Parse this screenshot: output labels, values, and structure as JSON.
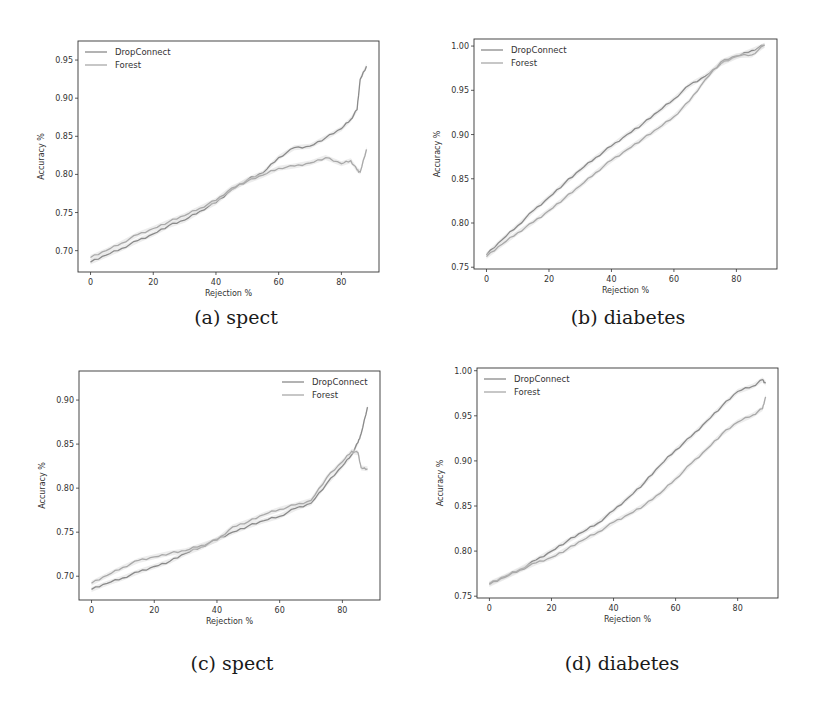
{
  "figure": {
    "captions": [
      "(a) spect",
      "(b) diabetes",
      "(c) spect",
      "(d) diabetes"
    ]
  },
  "colors": {
    "dropconnect": "#8a8a8a",
    "forest": "#a9a9a9",
    "band": "#dcdcdc",
    "frame": "#333333"
  },
  "chart_data": [
    {
      "id": "a",
      "type": "line",
      "title": "",
      "caption": "(a) spect",
      "xlabel": "Rejection %",
      "ylabel": "Accuracy %",
      "xlim": [
        -4,
        92
      ],
      "ylim": [
        0.672,
        0.975
      ],
      "xticks": [
        0,
        20,
        40,
        60,
        80
      ],
      "yticks": [
        0.7,
        0.75,
        0.8,
        0.85,
        0.9,
        0.95
      ],
      "ytick_labels": [
        "0.70",
        "0.75",
        "0.80",
        "0.85",
        "0.90",
        "0.95"
      ],
      "grid": false,
      "legend": {
        "position": "upper left",
        "entries": [
          "DropConnect",
          "Forest"
        ]
      },
      "x": [
        0,
        5,
        10,
        15,
        20,
        25,
        30,
        35,
        40,
        45,
        50,
        55,
        60,
        65,
        70,
        75,
        80,
        83,
        85,
        86,
        88
      ],
      "series": [
        {
          "name": "DropConnect",
          "values": [
            0.685,
            0.694,
            0.703,
            0.713,
            0.722,
            0.733,
            0.74,
            0.752,
            0.763,
            0.78,
            0.793,
            0.802,
            0.822,
            0.835,
            0.837,
            0.848,
            0.86,
            0.872,
            0.885,
            0.925,
            0.942
          ]
        },
        {
          "name": "Forest",
          "values": [
            0.691,
            0.7,
            0.71,
            0.721,
            0.729,
            0.738,
            0.746,
            0.756,
            0.766,
            0.782,
            0.791,
            0.799,
            0.808,
            0.811,
            0.815,
            0.822,
            0.814,
            0.818,
            0.806,
            0.803,
            0.833
          ]
        }
      ]
    },
    {
      "id": "b",
      "type": "line",
      "title": "",
      "caption": "(b) diabetes",
      "xlabel": "Rejection %",
      "ylabel": "Accuracy %",
      "xlim": [
        -4,
        93
      ],
      "ylim": [
        0.748,
        1.008
      ],
      "xticks": [
        0,
        20,
        40,
        60,
        80
      ],
      "yticks": [
        0.75,
        0.8,
        0.85,
        0.9,
        0.95,
        1.0
      ],
      "ytick_labels": [
        "0.75",
        "0.80",
        "0.85",
        "0.90",
        "0.95",
        "1.00"
      ],
      "grid": false,
      "legend": {
        "position": "upper left",
        "entries": [
          "DropConnect",
          "Forest"
        ]
      },
      "x": [
        0,
        5,
        10,
        15,
        20,
        25,
        30,
        35,
        40,
        45,
        50,
        55,
        60,
        65,
        70,
        75,
        80,
        85,
        89
      ],
      "series": [
        {
          "name": "DropConnect",
          "values": [
            0.764,
            0.781,
            0.797,
            0.814,
            0.829,
            0.845,
            0.86,
            0.874,
            0.887,
            0.9,
            0.912,
            0.926,
            0.94,
            0.956,
            0.966,
            0.98,
            0.988,
            0.995,
            1.001
          ]
        },
        {
          "name": "Forest",
          "values": [
            0.762,
            0.776,
            0.789,
            0.801,
            0.814,
            0.828,
            0.842,
            0.857,
            0.871,
            0.883,
            0.895,
            0.907,
            0.92,
            0.938,
            0.962,
            0.982,
            0.989,
            0.99,
            1.001
          ]
        }
      ]
    },
    {
      "id": "c",
      "type": "line",
      "title": "",
      "caption": "(c) spect",
      "xlabel": "Rejection %",
      "ylabel": "Accuracy %",
      "xlim": [
        -4,
        92
      ],
      "ylim": [
        0.673,
        0.933
      ],
      "xticks": [
        0,
        20,
        40,
        60,
        80
      ],
      "yticks": [
        0.7,
        0.75,
        0.8,
        0.85,
        0.9
      ],
      "ytick_labels": [
        "0.70",
        "0.75",
        "0.80",
        "0.85",
        "0.90"
      ],
      "grid": false,
      "legend": {
        "position": "upper right",
        "entries": [
          "DropConnect",
          "Forest"
        ]
      },
      "x": [
        0,
        5,
        10,
        15,
        20,
        25,
        30,
        35,
        40,
        45,
        50,
        55,
        60,
        65,
        70,
        75,
        80,
        83,
        85,
        86,
        88
      ],
      "series": [
        {
          "name": "DropConnect",
          "values": [
            0.685,
            0.692,
            0.698,
            0.705,
            0.711,
            0.717,
            0.726,
            0.733,
            0.742,
            0.75,
            0.757,
            0.763,
            0.768,
            0.777,
            0.783,
            0.805,
            0.825,
            0.838,
            0.852,
            0.862,
            0.892
          ]
        },
        {
          "name": "Forest",
          "values": [
            0.692,
            0.701,
            0.71,
            0.718,
            0.722,
            0.726,
            0.729,
            0.735,
            0.741,
            0.756,
            0.762,
            0.77,
            0.776,
            0.781,
            0.786,
            0.812,
            0.83,
            0.842,
            0.84,
            0.823,
            0.822
          ]
        }
      ]
    },
    {
      "id": "d",
      "type": "line",
      "title": "",
      "caption": "(d) diabetes",
      "xlabel": "Rejection %",
      "ylabel": "Accuracy %",
      "xlim": [
        -4,
        93
      ],
      "ylim": [
        0.748,
        1.003
      ],
      "xticks": [
        0,
        20,
        40,
        60,
        80
      ],
      "yticks": [
        0.75,
        0.8,
        0.85,
        0.9,
        0.95,
        1.0
      ],
      "ytick_labels": [
        "0.75",
        "0.80",
        "0.85",
        "0.90",
        "0.95",
        "1.00"
      ],
      "grid": false,
      "legend": {
        "position": "upper left",
        "entries": [
          "DropConnect",
          "Forest"
        ]
      },
      "x": [
        0,
        5,
        10,
        15,
        20,
        25,
        30,
        35,
        40,
        45,
        50,
        55,
        60,
        65,
        70,
        75,
        80,
        85,
        88,
        89
      ],
      "series": [
        {
          "name": "DropConnect",
          "values": [
            0.764,
            0.772,
            0.78,
            0.79,
            0.8,
            0.811,
            0.821,
            0.831,
            0.845,
            0.86,
            0.876,
            0.895,
            0.912,
            0.927,
            0.944,
            0.961,
            0.977,
            0.983,
            0.99,
            0.986
          ]
        },
        {
          "name": "Forest",
          "values": [
            0.763,
            0.771,
            0.779,
            0.787,
            0.793,
            0.802,
            0.812,
            0.821,
            0.832,
            0.841,
            0.851,
            0.864,
            0.88,
            0.897,
            0.913,
            0.93,
            0.943,
            0.951,
            0.958,
            0.971
          ]
        }
      ]
    }
  ]
}
